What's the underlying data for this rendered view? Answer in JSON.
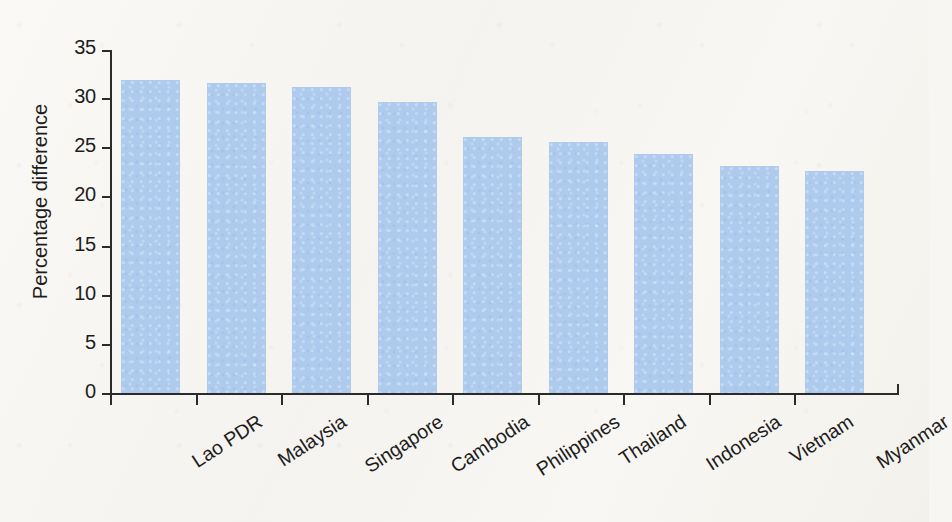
{
  "chart_data": {
    "type": "bar",
    "title": "",
    "xlabel": "",
    "ylabel": "Percentage difference",
    "ylim": [
      0,
      35
    ],
    "ytick_labels": [
      "35",
      "30",
      "25",
      "20",
      "15",
      "10",
      "5",
      "0"
    ],
    "yticks": [
      35,
      30,
      25,
      20,
      15,
      10,
      5,
      0
    ],
    "grid": false,
    "legend": "none",
    "bar_color": "#aecbee",
    "axis_color": "#2b2b2b",
    "background_color": "#f7f6f2",
    "categories": [
      "Lao PDR",
      "Malaysia",
      "Singapore",
      "Cambodia",
      "Philippines",
      "Thailand",
      "Indonesia",
      "Vietnam",
      "Myanmar"
    ],
    "values": [
      31.9,
      31.6,
      31.2,
      29.7,
      26.1,
      25.6,
      24.4,
      23.2,
      22.7
    ]
  }
}
